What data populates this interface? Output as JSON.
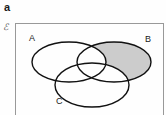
{
  "figure": {
    "panel_letter": "a",
    "universe_symbol": "ℰ",
    "background_color": "#fefefe",
    "border_color": "#999999",
    "outline_color": "#111111",
    "shade_color": "#cccccc"
  },
  "chart_data": {
    "type": "diagram",
    "diagram_type": "venn",
    "title": "",
    "set_count": 3,
    "universe_label": "ℰ",
    "sets": [
      {
        "name": "A",
        "label": "A",
        "label_x": 29,
        "label_y": 41,
        "cx": 69,
        "cy": 62,
        "rx": 37,
        "ry": 20,
        "shaded": false
      },
      {
        "name": "B",
        "label": "B",
        "label_x": 148,
        "label_y": 42,
        "cx": 114,
        "cy": 62,
        "rx": 37,
        "ry": 20,
        "shaded": true
      },
      {
        "name": "C",
        "label": "C",
        "label_x": 56,
        "label_y": 104,
        "cx": 92,
        "cy": 85,
        "rx": 37,
        "ry": 22,
        "shaded": false
      }
    ],
    "shaded_regions": [
      {
        "expression": "B \\ (A ∪ C)",
        "description": "region inside B only, excluding A and C",
        "fill": "#cccccc"
      }
    ],
    "frame": {
      "x": 15,
      "y": 23,
      "width": 148,
      "height": 96,
      "stroke": "#999999"
    }
  }
}
